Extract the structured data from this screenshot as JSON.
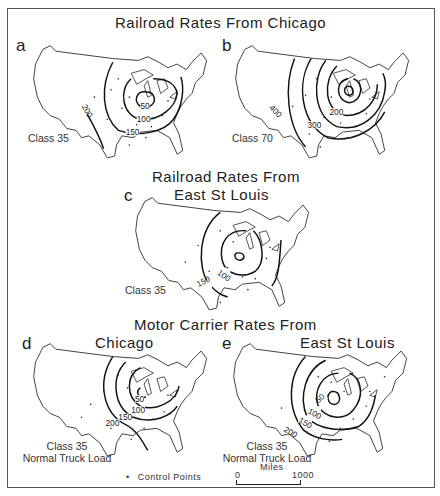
{
  "figure": {
    "title_top": "Railroad Rates From Chicago",
    "title_middle_line1": "Railroad Rates From",
    "title_middle_line2": "East St Louis",
    "title_bottom": "Motor Carrier Rates From",
    "colors": {
      "line": "#111111",
      "background": "#ffffff",
      "frame": "#555555"
    }
  },
  "maps": [
    {
      "id": "a",
      "letter": "a",
      "origin": "Chicago",
      "mode": "Railroad",
      "caption_line1": "Class 35",
      "caption_line2": "",
      "contours": [
        50,
        100,
        150,
        200
      ],
      "contour_labels": [
        "50",
        "100",
        "150",
        "200"
      ]
    },
    {
      "id": "b",
      "letter": "b",
      "origin": "Chicago",
      "mode": "Railroad",
      "caption_line1": "Class 70",
      "caption_line2": "",
      "contours": [
        100,
        200,
        300,
        400
      ],
      "contour_labels": [
        "200",
        "300",
        "400"
      ]
    },
    {
      "id": "c",
      "letter": "c",
      "origin": "East St Louis",
      "mode": "Railroad",
      "caption_line1": "Class 35",
      "caption_line2": "",
      "contours": [
        50,
        100,
        150
      ],
      "contour_labels": [
        "100",
        "150"
      ]
    },
    {
      "id": "d",
      "letter": "d",
      "origin": "Chicago",
      "subtitle": "Chicago",
      "mode": "Motor Carrier",
      "caption_line1": "Class 35",
      "caption_line2": "Normal Truck Load",
      "contours": [
        50,
        100,
        150,
        200
      ],
      "contour_labels": [
        "50",
        "100",
        "150",
        "200"
      ]
    },
    {
      "id": "e",
      "letter": "e",
      "origin": "East St Louis",
      "subtitle": "East St Louis",
      "mode": "Motor Carrier",
      "caption_line1": "Class 35",
      "caption_line2": "Normal Truck Load",
      "contours": [
        50,
        100,
        150,
        200
      ],
      "contour_labels": [
        "50",
        "100",
        "150",
        "200"
      ]
    }
  ],
  "legend": {
    "control_points_symbol": "•",
    "control_points_label": "Control Points",
    "scale_title": "Miles",
    "scale_min": "0",
    "scale_max": "1000"
  }
}
